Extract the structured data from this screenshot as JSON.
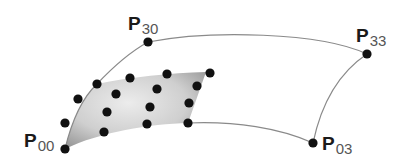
{
  "diagram": {
    "colors": {
      "curve": "#888888",
      "point": "#111111",
      "patch_light": "#e6e6e6",
      "patch_dark": "#9a9a9a"
    },
    "corner_labels": [
      {
        "id": "p00",
        "letter": "P",
        "subscript": "00",
        "x": 24,
        "y": 131
      },
      {
        "id": "p30",
        "letter": "P",
        "subscript": "30",
        "x": 128,
        "y": 14
      },
      {
        "id": "p33",
        "letter": "P",
        "subscript": "33",
        "x": 356,
        "y": 26
      },
      {
        "id": "p03",
        "letter": "P",
        "subscript": "03",
        "x": 322,
        "y": 134
      }
    ],
    "corner_points": [
      {
        "id": "p00",
        "x": 65,
        "y": 149
      },
      {
        "id": "p30",
        "x": 148,
        "y": 42
      },
      {
        "id": "p33",
        "x": 367,
        "y": 54
      },
      {
        "id": "p03",
        "x": 313,
        "y": 143
      }
    ],
    "control_points": [
      {
        "x": 65,
        "y": 123
      },
      {
        "x": 78,
        "y": 99
      },
      {
        "x": 97,
        "y": 84
      },
      {
        "x": 130,
        "y": 78
      },
      {
        "x": 167,
        "y": 74
      },
      {
        "x": 210,
        "y": 73
      },
      {
        "x": 116,
        "y": 94
      },
      {
        "x": 157,
        "y": 89
      },
      {
        "x": 197,
        "y": 86
      },
      {
        "x": 107,
        "y": 112
      },
      {
        "x": 150,
        "y": 107
      },
      {
        "x": 189,
        "y": 103
      },
      {
        "x": 104,
        "y": 132
      },
      {
        "x": 147,
        "y": 124
      },
      {
        "x": 188,
        "y": 123
      }
    ]
  }
}
